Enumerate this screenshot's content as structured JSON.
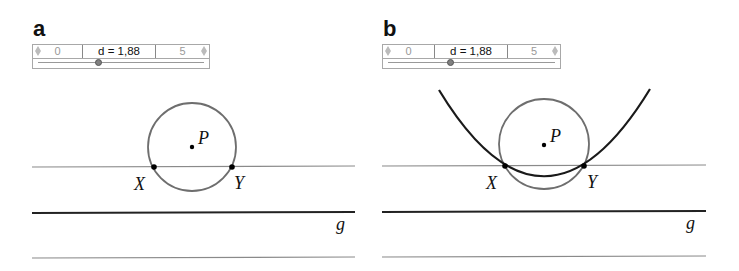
{
  "panels": [
    {
      "label": "a",
      "slider": {
        "min": "0",
        "max": "5",
        "value_text": "d = 1,88",
        "value": 1.88
      },
      "points": {
        "P": "P",
        "X": "X",
        "Y": "Y"
      },
      "line_label": "g",
      "has_parabola": false
    },
    {
      "label": "b",
      "slider": {
        "min": "0",
        "max": "5",
        "value_text": "d = 1,88",
        "value": 1.88
      },
      "points": {
        "P": "P",
        "X": "X",
        "Y": "Y"
      },
      "line_label": "g",
      "has_parabola": true
    }
  ],
  "colors": {
    "circle": "#6e6e6e",
    "thin_line": "#8a8a8a",
    "directrix": "#222222",
    "parabola": "#1a1a1a",
    "point": "#000000"
  }
}
